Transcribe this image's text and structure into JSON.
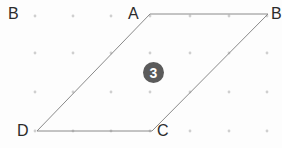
{
  "figure": {
    "type": "geometry-parallelogram-on-dot-grid",
    "width": 282,
    "height": 148,
    "background_color": "#fdfdfd",
    "shape": {
      "name": "parallelogram",
      "stroke_color": "#8a8a8a",
      "stroke_width": 1,
      "fill": "none",
      "vertices": [
        {
          "label": "A",
          "x": 150,
          "y": 14,
          "label_x": 128,
          "label_y": 6
        },
        {
          "label": "B",
          "x": 268,
          "y": 14,
          "label_x": 271,
          "label_y": 6
        },
        {
          "label": "C",
          "x": 152,
          "y": 131,
          "label_x": 157,
          "label_y": 123
        },
        {
          "label": "D",
          "x": 37,
          "y": 131,
          "label_x": 17,
          "label_y": 123
        }
      ],
      "edges": [
        {
          "from": "A",
          "to": "B"
        },
        {
          "from": "B",
          "to": "C"
        },
        {
          "from": "C",
          "to": "D"
        },
        {
          "from": "D",
          "to": "A"
        }
      ]
    },
    "outside_label": {
      "label": "B",
      "x": 8,
      "y": 6
    },
    "badge": {
      "value": "3",
      "x": 143,
      "y": 62,
      "background_color": "#5b5b5b",
      "text_color": "#ffffff"
    },
    "dot_grid": {
      "color": "#cfcfcf",
      "radius": 1.4,
      "x_positions": [
        35,
        73,
        111,
        150,
        190,
        229,
        267
      ],
      "y_positions": [
        16,
        53,
        92,
        131
      ]
    }
  }
}
